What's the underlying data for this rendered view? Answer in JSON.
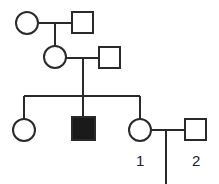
{
  "diagram": {
    "type": "pedigree",
    "colors": {
      "line": "#2a2a2a",
      "affected": "#1a1a1a",
      "unaffected": "#ffffff"
    },
    "generations": [
      {
        "gen": "I",
        "members": [
          {
            "id": "I-1",
            "sex": "female",
            "affected": false
          },
          {
            "id": "I-2",
            "sex": "male",
            "affected": false
          }
        ]
      },
      {
        "gen": "II",
        "members": [
          {
            "id": "II-1",
            "sex": "female",
            "affected": false,
            "parents": [
              "I-1",
              "I-2"
            ]
          },
          {
            "id": "II-2",
            "sex": "male",
            "affected": false
          }
        ]
      },
      {
        "gen": "III",
        "members": [
          {
            "id": "III-1",
            "sex": "female",
            "affected": false,
            "parents": [
              "II-1",
              "II-2"
            ]
          },
          {
            "id": "III-2",
            "sex": "male",
            "affected": true,
            "parents": [
              "II-1",
              "II-2"
            ]
          },
          {
            "id": "III-3",
            "sex": "female",
            "affected": false,
            "parents": [
              "II-1",
              "II-2"
            ],
            "label": "1"
          },
          {
            "id": "III-4",
            "sex": "male",
            "affected": false,
            "label": "2"
          }
        ]
      }
    ],
    "labels": {
      "individual_1": "1",
      "individual_2": "2"
    }
  }
}
